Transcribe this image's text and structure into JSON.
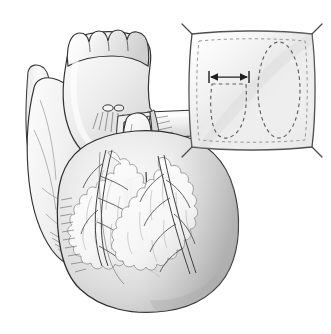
{
  "figure": {
    "title": "Surgical illustration of heart with transected great vessels and ventriculotomy",
    "caption": "",
    "background_color": "#ffffff",
    "ink_color": "#262626",
    "line_color": "#3a3a3a",
    "fill_light": "#f2f2f2",
    "fill_mid": "#dcdcdc",
    "fill_dark": "#c2c2c2",
    "hatch_color": "#4a4a4a",
    "dash_color": "#5a5a5a"
  },
  "main_illustration": {
    "name": "heart-anterior-view",
    "parts": [
      {
        "id": "aortic-root",
        "label": "Aortic root with scalloped cut edge"
      },
      {
        "id": "ascending-aorta",
        "label": "Ascending aorta"
      },
      {
        "id": "aortic-arch",
        "label": "Aortic arch"
      },
      {
        "id": "superior-vena-cava",
        "label": "Superior vena cava"
      },
      {
        "id": "right-atrial-appendage",
        "label": "Right atrial appendage"
      },
      {
        "id": "pulmonary-artery-stump",
        "label": "Transected pulmonary artery stump"
      },
      {
        "id": "pulmonary-trunk-opened",
        "label": "Opened pulmonary trunk"
      },
      {
        "id": "left-atrial-appendage",
        "label": "Left atrial appendage"
      },
      {
        "id": "right-ventricle",
        "label": "Right ventricle"
      },
      {
        "id": "left-ventricle",
        "label": "Left ventricle"
      },
      {
        "id": "ventriculotomy",
        "label": "Vertical right ventricular outflow tract incision"
      },
      {
        "id": "lad-coronary-artery",
        "label": "Left anterior descending coronary artery"
      },
      {
        "id": "rca-coronary-artery",
        "label": "Right coronary artery"
      },
      {
        "id": "epicardial-fat",
        "label": "Epicardial fat"
      }
    ]
  },
  "inset": {
    "name": "patch-template-inset",
    "label": "Patch template with sizing outlines",
    "border_color": "#4a4a4a",
    "fill_color": "#f7f7f7",
    "dash_color": "#6a6a6a",
    "corner_tails": 4,
    "shapes": [
      {
        "id": "ventricle-outline",
        "label": "Dashed ventricle outline",
        "style": "dashed"
      },
      {
        "id": "ellipse-outline",
        "label": "Dashed ellipse outline",
        "style": "dashed"
      }
    ],
    "dimension_arrow": {
      "id": "width-dimension-arrow",
      "label": "Double-headed width measurement arrow",
      "value": ""
    }
  }
}
